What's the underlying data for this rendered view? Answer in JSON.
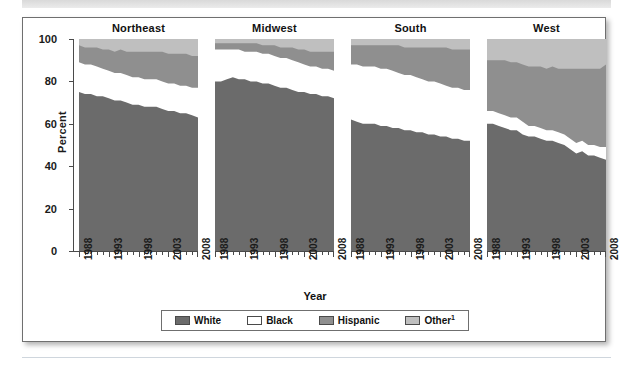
{
  "chart_data": {
    "type": "area",
    "title": "",
    "xlabel": "Year",
    "ylabel": "Percent",
    "ylim": [
      0,
      100
    ],
    "yticks": [
      0,
      20,
      40,
      60,
      80,
      100
    ],
    "xlim": [
      1988,
      2008
    ],
    "xticklabels": [
      "1988",
      "1993",
      "1998",
      "2003",
      "2008"
    ],
    "grid": false,
    "legend_position": "bottom",
    "stacked": true,
    "series_names": [
      "White",
      "Black",
      "Hispanic",
      "Other"
    ],
    "colors": {
      "White": "#6b6b6b",
      "Black": "#ffffff",
      "Hispanic": "#8f8f8f",
      "Other": "#bfbfbf",
      "axis": "#4a4a4a",
      "text": "#111111",
      "frame": "#6f6f6f"
    },
    "x": [
      1988,
      1989,
      1990,
      1991,
      1992,
      1993,
      1994,
      1995,
      1996,
      1997,
      1998,
      1999,
      2000,
      2001,
      2002,
      2003,
      2004,
      2005,
      2006,
      2007,
      2008
    ],
    "panels": [
      {
        "name": "Northeast",
        "series": [
          {
            "name": "White",
            "values": [
              75,
              74,
              74,
              73,
              73,
              72,
              71,
              71,
              70,
              69,
              69,
              68,
              68,
              68,
              67,
              66,
              66,
              65,
              65,
              64,
              63
            ]
          },
          {
            "name": "Black",
            "values": [
              14,
              14,
              14,
              14,
              13,
              13,
              13,
              13,
              13,
              13,
              13,
              13,
              13,
              13,
              13,
              13,
              13,
              13,
              13,
              13,
              14
            ]
          },
          {
            "name": "Hispanic",
            "values": [
              8,
              8,
              8,
              9,
              9,
              10,
              10,
              11,
              11,
              12,
              12,
              13,
              13,
              13,
              14,
              14,
              14,
              15,
              15,
              15,
              15
            ]
          },
          {
            "name": "Other",
            "values": [
              3,
              4,
              4,
              4,
              5,
              5,
              6,
              5,
              6,
              6,
              6,
              6,
              6,
              6,
              6,
              7,
              7,
              7,
              7,
              8,
              8
            ]
          }
        ]
      },
      {
        "name": "Midwest",
        "series": [
          {
            "name": "White",
            "values": [
              80,
              80,
              81,
              82,
              81,
              81,
              80,
              80,
              79,
              79,
              78,
              77,
              77,
              76,
              75,
              75,
              74,
              74,
              73,
              73,
              72
            ]
          },
          {
            "name": "Black",
            "values": [
              15,
              15,
              14,
              13,
              14,
              13,
              14,
              14,
              14,
              14,
              14,
              14,
              14,
              14,
              14,
              13,
              13,
              13,
              13,
              13,
              13
            ]
          },
          {
            "name": "Hispanic",
            "values": [
              3,
              3,
              3,
              3,
              3,
              4,
              4,
              4,
              4,
              4,
              5,
              5,
              5,
              6,
              6,
              7,
              7,
              7,
              8,
              8,
              9
            ]
          },
          {
            "name": "Other",
            "values": [
              2,
              2,
              2,
              2,
              2,
              2,
              2,
              2,
              3,
              3,
              3,
              4,
              4,
              4,
              5,
              5,
              6,
              6,
              6,
              6,
              6
            ]
          }
        ]
      },
      {
        "name": "South",
        "series": [
          {
            "name": "White",
            "values": [
              62,
              61,
              60,
              60,
              60,
              59,
              59,
              58,
              58,
              57,
              57,
              56,
              56,
              55,
              55,
              54,
              54,
              53,
              53,
              52,
              52
            ]
          },
          {
            "name": "Black",
            "values": [
              26,
              27,
              27,
              27,
              27,
              27,
              27,
              27,
              26,
              26,
              26,
              26,
              25,
              25,
              25,
              25,
              24,
              24,
              24,
              24,
              24
            ]
          },
          {
            "name": "Hispanic",
            "values": [
              9,
              9,
              10,
              10,
              10,
              11,
              11,
              12,
              13,
              13,
              13,
              14,
              15,
              16,
              16,
              17,
              18,
              18,
              18,
              19,
              19
            ]
          },
          {
            "name": "Other",
            "values": [
              3,
              3,
              3,
              3,
              3,
              3,
              3,
              3,
              3,
              4,
              4,
              4,
              4,
              4,
              4,
              4,
              4,
              5,
              5,
              5,
              5
            ]
          }
        ]
      },
      {
        "name": "West",
        "series": [
          {
            "name": "White",
            "values": [
              60,
              60,
              59,
              58,
              57,
              57,
              55,
              54,
              54,
              53,
              52,
              52,
              51,
              50,
              48,
              46,
              47,
              45,
              45,
              44,
              43
            ]
          },
          {
            "name": "Black",
            "values": [
              6,
              6,
              6,
              6,
              6,
              6,
              6,
              5,
              5,
              5,
              5,
              5,
              5,
              5,
              5,
              5,
              5,
              5,
              5,
              5,
              6
            ]
          },
          {
            "name": "Hispanic",
            "values": [
              24,
              24,
              25,
              26,
              26,
              26,
              27,
              28,
              28,
              29,
              29,
              30,
              30,
              31,
              33,
              35,
              34,
              36,
              36,
              37,
              39
            ]
          },
          {
            "name": "Other",
            "values": [
              10,
              10,
              10,
              10,
              11,
              11,
              12,
              13,
              13,
              13,
              14,
              13,
              14,
              14,
              14,
              14,
              14,
              14,
              14,
              14,
              12
            ]
          }
        ]
      }
    ],
    "legend": [
      {
        "label": "White",
        "color": "#6b6b6b",
        "superscript": ""
      },
      {
        "label": "Black",
        "color": "#ffffff",
        "superscript": ""
      },
      {
        "label": "Hispanic",
        "color": "#8f8f8f",
        "superscript": ""
      },
      {
        "label": "Other",
        "color": "#bfbfbf",
        "superscript": "1"
      }
    ]
  }
}
